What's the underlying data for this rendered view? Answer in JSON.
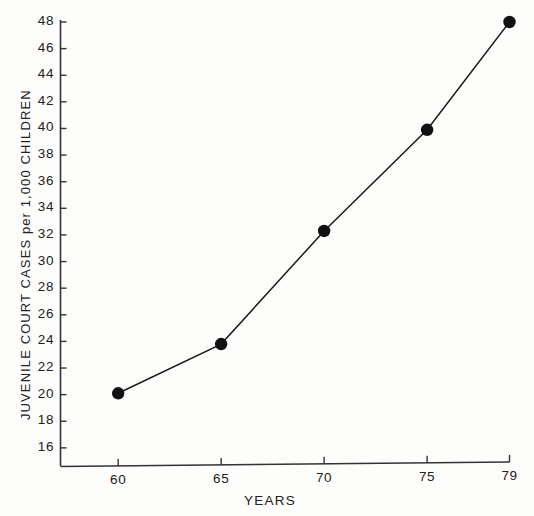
{
  "chart_data": {
    "type": "line",
    "title": "",
    "xlabel": "YEARS",
    "ylabel": "JUVENILE  COURT  CASES  per  1,000 CHILDREN",
    "x": [
      60,
      65,
      70,
      75,
      79
    ],
    "values": [
      20.1,
      23.8,
      32.3,
      39.9,
      48.0
    ],
    "series": [
      {
        "name": "Juvenile court cases per 1,000 children",
        "x": [
          60,
          65,
          70,
          75,
          79
        ],
        "values": [
          20.1,
          23.8,
          32.3,
          39.9,
          48.0
        ]
      }
    ],
    "xlim": [
      57.2,
      79
    ],
    "ylim": [
      14.6,
      48
    ],
    "xtick_labels": [
      "60",
      "65",
      "70",
      "75",
      "79"
    ],
    "xticks": [
      60,
      65,
      70,
      75,
      79
    ],
    "ytick_labels": [
      "16",
      "18",
      "20",
      "22",
      "24",
      "26",
      "28",
      "30",
      "32",
      "34",
      "36",
      "38",
      "40",
      "42",
      "44",
      "46",
      "48"
    ],
    "yticks": [
      16,
      18,
      20,
      22,
      24,
      26,
      28,
      30,
      32,
      34,
      36,
      38,
      40,
      42,
      44,
      46,
      48
    ],
    "grid": false,
    "legend": null,
    "marker": "filled-circle",
    "line_color": "#1a1a1a",
    "marker_color": "#111111",
    "axis_color": "#333333",
    "background_color": "#fdfdfc"
  }
}
